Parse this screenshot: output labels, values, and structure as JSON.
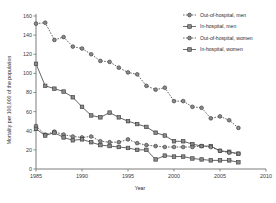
{
  "chart_data": {
    "type": "line",
    "title": "",
    "xlabel": "Year",
    "ylabel": "Mortality per 100,000 of the population",
    "xlim": [
      1985,
      2010
    ],
    "ylim": [
      0,
      160
    ],
    "xticks": [
      1985,
      1990,
      1995,
      2000,
      2005,
      2010
    ],
    "yticks": [
      0,
      20,
      40,
      60,
      80,
      100,
      120,
      140,
      160
    ],
    "grid": false,
    "legend_position": "top-right",
    "x": [
      1985,
      1986,
      1987,
      1988,
      1989,
      1990,
      1991,
      1992,
      1993,
      1994,
      1995,
      1996,
      1997,
      1998,
      1999,
      2000,
      2001,
      2002,
      2003,
      2004,
      2005,
      2006,
      2007
    ],
    "series": [
      {
        "name": "Out-of-hospital, men",
        "marker": "circle",
        "line": "dashed",
        "values": [
          152,
          153,
          135,
          138,
          128,
          126,
          120,
          113,
          112,
          106,
          101,
          99,
          87,
          83,
          85,
          71,
          71,
          65,
          64,
          53,
          55,
          51,
          43
        ]
      },
      {
        "name": "In-hospital, men",
        "marker": "square",
        "line": "solid",
        "values": [
          110,
          87,
          84,
          81,
          75,
          65,
          56,
          54,
          59,
          54,
          50,
          47,
          44,
          38,
          35,
          29,
          29,
          26,
          24,
          24,
          19,
          18,
          16
        ]
      },
      {
        "name": "Out-of-hospital, women",
        "marker": "circle",
        "line": "dashed",
        "values": [
          45,
          36,
          39,
          36,
          34,
          33,
          34,
          29,
          28,
          28,
          31,
          27,
          25,
          24,
          23,
          23,
          23,
          23,
          24,
          23,
          19,
          17,
          16
        ]
      },
      {
        "name": "In-hospital, women",
        "marker": "square",
        "line": "solid",
        "values": [
          42,
          35,
          38,
          33,
          30,
          31,
          28,
          25,
          24,
          23,
          22,
          20,
          20,
          10,
          14,
          13,
          13,
          11,
          10,
          9,
          9,
          9,
          7
        ]
      }
    ]
  },
  "legend": {
    "items": [
      {
        "label": "Out-of-hospital, men"
      },
      {
        "label": "In-hospital, men"
      },
      {
        "label": "Out-of-hospital, women"
      },
      {
        "label": "In-hospital, women"
      }
    ]
  },
  "colors": {
    "marker_fill": "#8a8a8a",
    "marker_stroke": "#3c3c3c",
    "line": "#4a4a4a",
    "axis": "#6e6e6e",
    "text": "#2b2b2b",
    "background": "#ffffff"
  }
}
